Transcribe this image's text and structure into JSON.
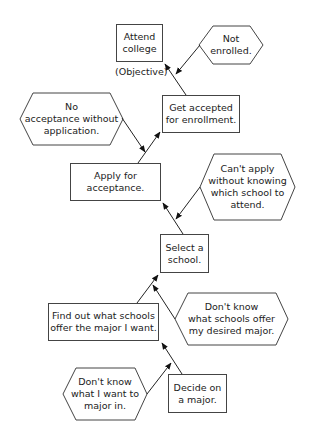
{
  "diagram": {
    "type": "prerequisite-tree",
    "objective_label": "(Objective)",
    "nodes": {
      "attend": {
        "text": "Attend\ncollege",
        "shape": "rect"
      },
      "not_enrolled": {
        "text": "Not\nenrolled.",
        "shape": "hexagon"
      },
      "get_accepted": {
        "text": "Get accepted\nfor enrollment.",
        "shape": "rect"
      },
      "no_acceptance": {
        "text": "No\nacceptance without\napplication.",
        "shape": "hexagon"
      },
      "apply": {
        "text": "Apply for\nacceptance.",
        "shape": "rect"
      },
      "cant_apply": {
        "text": "Can't apply\nwithout knowing\nwhich school to\nattend.",
        "shape": "hexagon"
      },
      "select_school": {
        "text": "Select a\nschool.",
        "shape": "rect"
      },
      "find_out": {
        "text": "Find out what schools\noffer the major I want.",
        "shape": "rect"
      },
      "dont_know_schools": {
        "text": "Don't know\nwhat schools offer\nmy desired major.",
        "shape": "hexagon"
      },
      "dont_know_major": {
        "text": "Don't know\nwhat I want to\nmajor in.",
        "shape": "hexagon"
      },
      "decide_major": {
        "text": "Decide on\na major.",
        "shape": "rect"
      }
    },
    "edges": [
      {
        "from": "get_accepted",
        "to": "attend"
      },
      {
        "from": "not_enrolled",
        "to": "attend"
      },
      {
        "from": "apply",
        "to": "get_accepted"
      },
      {
        "from": "no_acceptance",
        "to": "apply"
      },
      {
        "from": "select_school",
        "to": "apply"
      },
      {
        "from": "cant_apply",
        "to": "select_school"
      },
      {
        "from": "find_out",
        "to": "select_school"
      },
      {
        "from": "dont_know_schools",
        "to": "select_school"
      },
      {
        "from": "decide_major",
        "to": "find_out"
      },
      {
        "from": "dont_know_major",
        "to": "find_out"
      }
    ]
  }
}
